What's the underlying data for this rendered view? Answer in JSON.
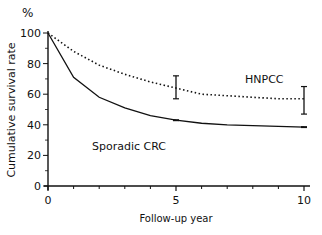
{
  "chart_data": {
    "type": "line",
    "title": "",
    "xlabel": "Follow-up year",
    "ylabel": "Cumulative survival rate",
    "yunit": "%",
    "xlim": [
      0,
      10
    ],
    "ylim": [
      0,
      100
    ],
    "xticks_major": [
      0,
      5,
      10
    ],
    "xticks_minor": [
      1,
      2,
      3,
      4,
      6,
      7,
      8,
      9
    ],
    "yticks": [
      0,
      20,
      40,
      60,
      80,
      100
    ],
    "grid": false,
    "legend": "inline labels",
    "series": [
      {
        "name": "HNPCC",
        "style": "dotted",
        "x": [
          0,
          1,
          2,
          3,
          4,
          5,
          6,
          7,
          8,
          9,
          10
        ],
        "values": [
          100,
          88,
          79,
          73,
          68,
          64,
          60,
          59,
          58,
          57,
          57
        ],
        "error_bars": [
          {
            "x": 5,
            "low": 57,
            "high": 72
          },
          {
            "x": 10,
            "low": 47,
            "high": 65
          }
        ],
        "label_position": {
          "x": 7.1,
          "y": 71
        }
      },
      {
        "name": "Sporadic CRC",
        "style": "solid",
        "x": [
          0,
          1,
          2,
          3,
          4,
          5,
          6,
          7,
          8,
          9,
          10
        ],
        "values": [
          100,
          71,
          58,
          51,
          46,
          43,
          41,
          40,
          39.5,
          39,
          38.5
        ],
        "markers": [
          5,
          10
        ],
        "label_position": {
          "x": 1.3,
          "y": 29
        }
      }
    ]
  },
  "axes": {
    "y_unit": "%",
    "y_title": "Cumulative survival rate",
    "x_title": "Follow-up year",
    "x_tick_labels": [
      "0",
      "5",
      "10"
    ],
    "y_tick_labels": [
      "0",
      "20",
      "40",
      "60",
      "80",
      "100"
    ]
  },
  "labels": {
    "hnpcc": "HNPCC",
    "sporadic": "Sporadic CRC"
  }
}
